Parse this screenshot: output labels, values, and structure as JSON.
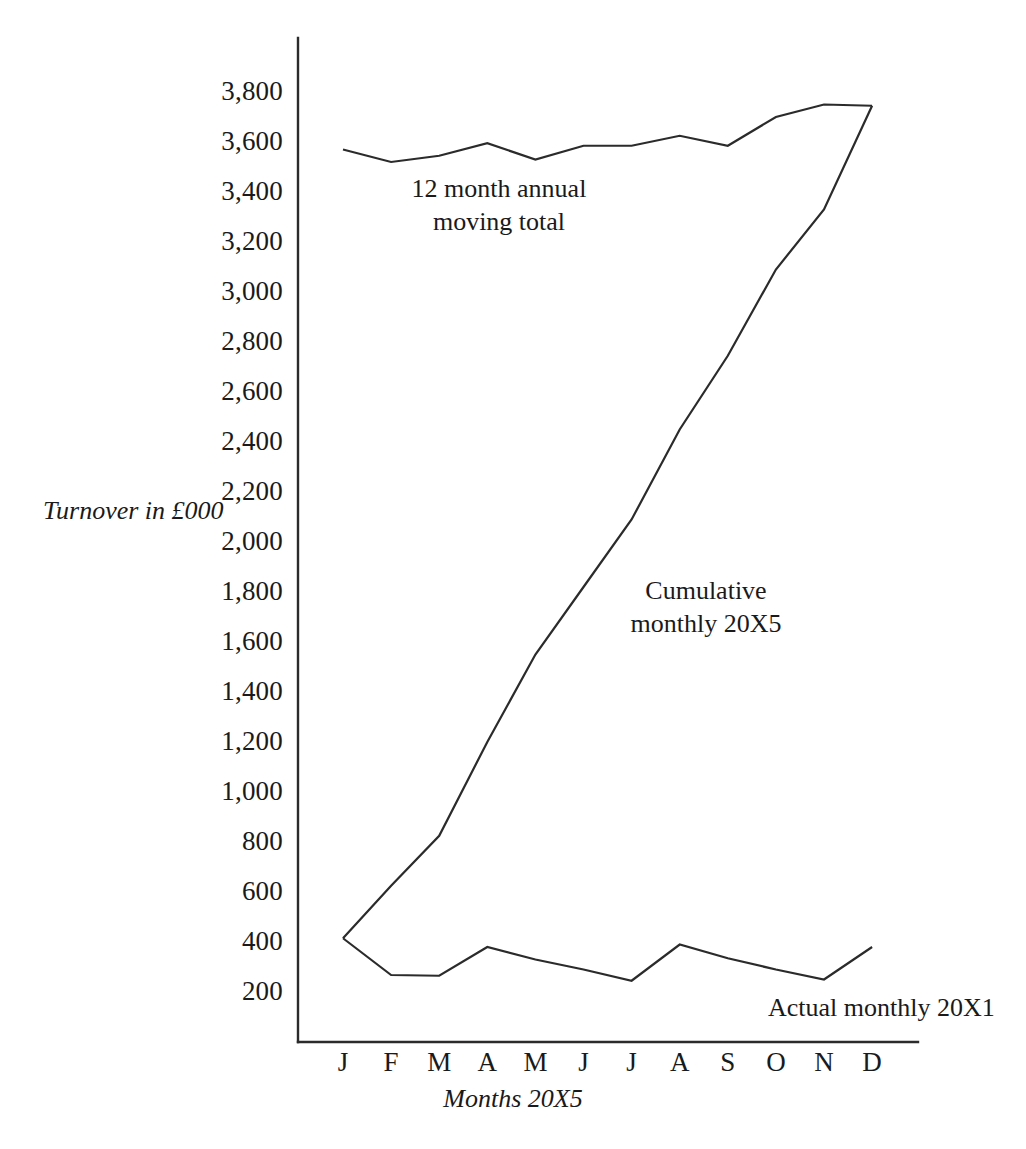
{
  "chart_data": {
    "type": "line",
    "title": "",
    "xlabel": "Months 20X5",
    "ylabel": "Turnover in £000",
    "categories": [
      "J",
      "F",
      "M",
      "A",
      "M",
      "J",
      "J",
      "A",
      "S",
      "O",
      "N",
      "D"
    ],
    "category_names": [
      "January",
      "February",
      "March",
      "April",
      "May",
      "June",
      "July",
      "August",
      "September",
      "October",
      "November",
      "December"
    ],
    "ylim": [
      0,
      3900
    ],
    "ytick_labels": [
      "3,800",
      "3,600",
      "3,400",
      "3,200",
      "3,000",
      "2,800",
      "2,600",
      "2,400",
      "2,200",
      "2,000",
      "1,800",
      "1,600",
      "1,400",
      "1,200",
      "1,000",
      "800",
      "600",
      "400",
      "200"
    ],
    "ytick_values": [
      3800,
      3600,
      3400,
      3200,
      3000,
      2800,
      2600,
      2400,
      2200,
      2000,
      1800,
      1600,
      1400,
      1200,
      1000,
      800,
      600,
      400,
      200
    ],
    "ytick_step": 200,
    "grid": false,
    "legend_position": "inline-annotations",
    "series": [
      {
        "name": "12 month annual moving total",
        "label": "12 month annual\nmoving total",
        "values": [
          3570,
          3520,
          3545,
          3595,
          3530,
          3585,
          3585,
          3625,
          3585,
          3700,
          3750,
          3745
        ]
      },
      {
        "name": "Cumulative monthly 20X5",
        "label": "Cumulative\nmonthly 20X5",
        "values": [
          415,
          625,
          825,
          1200,
          1550,
          1820,
          2090,
          2450,
          2745,
          3090,
          3330,
          3745
        ]
      },
      {
        "name": "Actual monthly 20X1",
        "label": "Actual monthly 20X1",
        "values": [
          415,
          268,
          265,
          380,
          330,
          290,
          245,
          390,
          335,
          290,
          250,
          380
        ]
      }
    ],
    "annotations": [
      {
        "id": "moving-total",
        "text": "12 month annual\nmoving total"
      },
      {
        "id": "cumulative",
        "text": "Cumulative\nmonthly 20X5"
      },
      {
        "id": "actual",
        "text": "Actual monthly 20X1"
      }
    ],
    "colors": {
      "line": "#2b2b2b",
      "axis": "#2b2b2b",
      "background": "#ffffff",
      "text": "#1a1a1a"
    }
  }
}
